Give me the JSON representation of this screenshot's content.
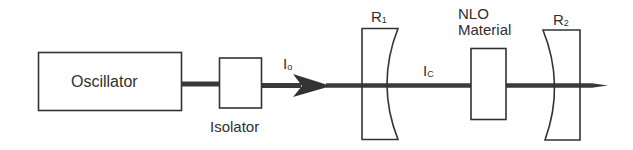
{
  "diagram": {
    "type": "optical-cavity-schematic",
    "components": {
      "oscillator": {
        "label": "Oscillator"
      },
      "isolator": {
        "label": "Isolator"
      },
      "mirror_1": {
        "label": "R",
        "subscript": "1"
      },
      "nlo": {
        "label_line1": "NLO",
        "label_line2": "Material"
      },
      "mirror_2": {
        "label": "R",
        "subscript": "2"
      }
    },
    "beams": {
      "input": {
        "label": "I",
        "subscript": "o"
      },
      "cavity": {
        "label": "I",
        "subscript": "C"
      }
    },
    "colors": {
      "line": "#333333",
      "beam": "#3a3a3a",
      "background": "#ffffff"
    }
  }
}
